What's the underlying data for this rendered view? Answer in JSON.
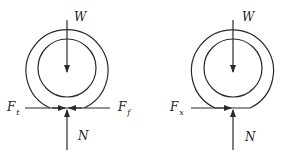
{
  "diagram": {
    "type": "free-body diagrams of wheels",
    "colors": {
      "stroke": "#2a2a2a",
      "background": "#ffffff"
    },
    "left_wheel": {
      "forces": {
        "weight": {
          "symbol": "W",
          "direction": "down"
        },
        "normal": {
          "symbol": "N",
          "direction": "up"
        },
        "traction": {
          "symbol": "F",
          "subscript": "t",
          "direction": "right"
        },
        "friction": {
          "symbol": "F",
          "subscript": "f",
          "direction": "left"
        }
      }
    },
    "right_wheel": {
      "forces": {
        "weight": {
          "symbol": "W",
          "direction": "down"
        },
        "normal": {
          "symbol": "N",
          "direction": "up"
        },
        "force_x": {
          "symbol": "F",
          "subscript": "x",
          "direction": "right"
        }
      }
    }
  }
}
